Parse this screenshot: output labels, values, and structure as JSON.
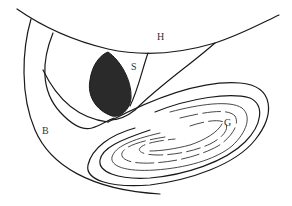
{
  "labels": {
    "H": "H",
    "S": "S",
    "B": "B",
    "G": "G"
  },
  "colors": {
    "line": "#1a1a1a",
    "fill_dark": "#2a2a2a",
    "background": "#ffffff"
  }
}
